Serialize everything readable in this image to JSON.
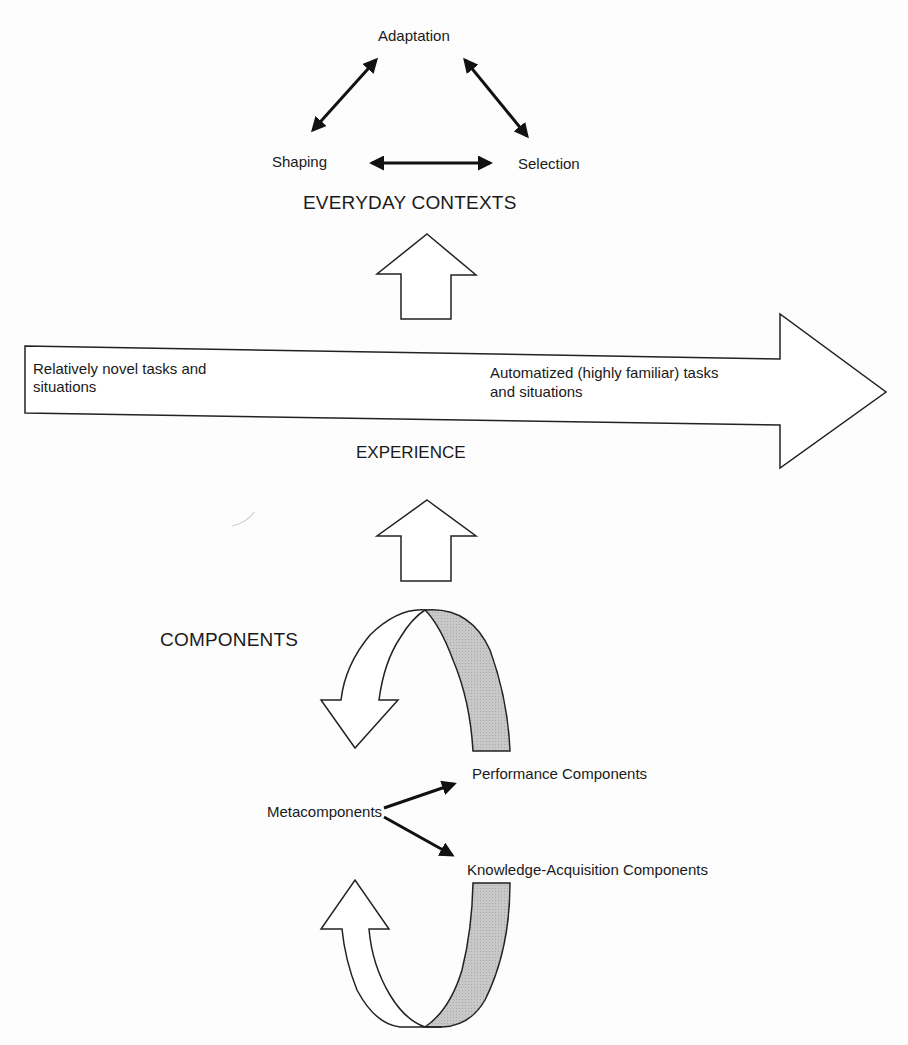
{
  "everyday_contexts": {
    "title": "EVERYDAY CONTEXTS",
    "nodes": {
      "adaptation": "Adaptation",
      "shaping": "Shaping",
      "selection": "Selection"
    }
  },
  "experience": {
    "title": "EXPERIENCE",
    "left_text_line1": "Relatively novel tasks and",
    "left_text_line2": "situations",
    "right_text_line1": "Automatized (highly familiar) tasks",
    "right_text_line2": "and situations"
  },
  "components": {
    "title": "COMPONENTS",
    "metacomponents": "Metacomponents",
    "performance": "Performance Components",
    "knowledge_acquisition": "Knowledge-Acquisition Components"
  },
  "colors": {
    "stroke": "#222222",
    "shaded_band": "#c4c4c4",
    "background": "#fdfdfd"
  }
}
